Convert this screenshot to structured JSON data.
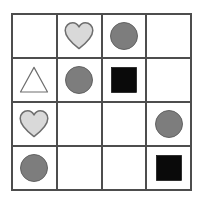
{
  "canvas": {
    "width": 203,
    "height": 204,
    "background": "#ffffff"
  },
  "grid": {
    "name": "shape-grid",
    "rows": 4,
    "columns": 4,
    "line_color": "#4d4d4d",
    "line_width_px": 2,
    "cell_background": "#ffffff"
  },
  "palette": {
    "heart_fill": "#d9d9d9",
    "heart_stroke": "#6e6e6e",
    "circle_fill": "#7d7d7d",
    "circle_stroke": "#5a5a5a",
    "square_fill": "#0a0a0a",
    "square_stroke": "#0a0a0a",
    "triangle_fill": "#ffffff",
    "triangle_stroke": "#6e6e6e"
  },
  "cells": [
    {
      "row": 1,
      "col": 1,
      "shape": "none",
      "label": "empty cell"
    },
    {
      "row": 1,
      "col": 2,
      "shape": "heart",
      "label": "light gray heart"
    },
    {
      "row": 1,
      "col": 3,
      "shape": "circle",
      "label": "gray circle"
    },
    {
      "row": 1,
      "col": 4,
      "shape": "none",
      "label": "empty cell"
    },
    {
      "row": 2,
      "col": 1,
      "shape": "triangle",
      "label": "white outlined triangle"
    },
    {
      "row": 2,
      "col": 2,
      "shape": "circle",
      "label": "gray circle"
    },
    {
      "row": 2,
      "col": 3,
      "shape": "square",
      "label": "black square"
    },
    {
      "row": 2,
      "col": 4,
      "shape": "none",
      "label": "empty cell"
    },
    {
      "row": 3,
      "col": 1,
      "shape": "heart",
      "label": "light gray heart"
    },
    {
      "row": 3,
      "col": 2,
      "shape": "none",
      "label": "empty cell"
    },
    {
      "row": 3,
      "col": 3,
      "shape": "none",
      "label": "empty cell"
    },
    {
      "row": 3,
      "col": 4,
      "shape": "circle",
      "label": "gray circle"
    },
    {
      "row": 4,
      "col": 1,
      "shape": "circle",
      "label": "gray circle"
    },
    {
      "row": 4,
      "col": 2,
      "shape": "none",
      "label": "empty cell"
    },
    {
      "row": 4,
      "col": 3,
      "shape": "none",
      "label": "empty cell"
    },
    {
      "row": 4,
      "col": 4,
      "shape": "square",
      "label": "black square"
    }
  ]
}
